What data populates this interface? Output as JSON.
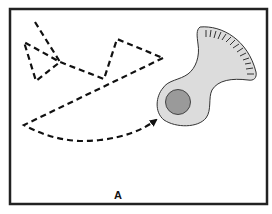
{
  "figure": {
    "panel_label": "A",
    "colors": {
      "frame": "#222222",
      "path": "#111111",
      "body_fill": "#dcdcdc",
      "nucleus_fill": "#9a9a9a",
      "background": "#ffffff"
    },
    "elements": [
      {
        "name": "random-walk-path",
        "type": "dashed-line"
      },
      {
        "name": "directed-path-arrow",
        "type": "dashed-arrow"
      },
      {
        "name": "cell-body",
        "type": "shape"
      },
      {
        "name": "nucleus",
        "type": "circle"
      },
      {
        "name": "fan-ticks",
        "type": "tick-marks"
      }
    ]
  }
}
